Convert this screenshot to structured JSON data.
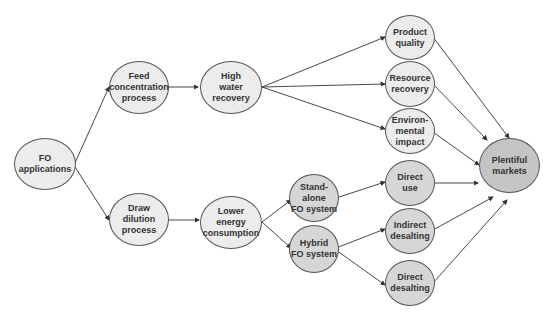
{
  "diagram": {
    "nodes": {
      "fo_applications": "FO\napplications",
      "feed_concentration": "Feed\nconcentration\nprocess",
      "draw_dilution": "Draw\ndilution\nprocess",
      "high_water_recovery": "High\nwater\nrecovery",
      "lower_energy": "Lower\nenergy\nconsumption",
      "product_quality": "Product\nquality",
      "resource_recovery": "Resource\nrecovery",
      "environmental_impact": "Environ-\nmental\nimpact",
      "standalone_fo": "Stand-alone\nFO system",
      "hybrid_fo": "Hybrid\nFO system",
      "direct_use": "Direct\nuse",
      "indirect_desalting": "Indirect\ndesalting",
      "direct_desalting": "Direct\ndesalting",
      "plentiful_markets": "Plentiful\nmarkets"
    },
    "edges": [
      [
        "fo_applications",
        "feed_concentration"
      ],
      [
        "fo_applications",
        "draw_dilution"
      ],
      [
        "feed_concentration",
        "high_water_recovery"
      ],
      [
        "draw_dilution",
        "lower_energy"
      ],
      [
        "high_water_recovery",
        "product_quality"
      ],
      [
        "high_water_recovery",
        "resource_recovery"
      ],
      [
        "high_water_recovery",
        "environmental_impact"
      ],
      [
        "lower_energy",
        "standalone_fo"
      ],
      [
        "lower_energy",
        "hybrid_fo"
      ],
      [
        "standalone_fo",
        "direct_use"
      ],
      [
        "hybrid_fo",
        "indirect_desalting"
      ],
      [
        "hybrid_fo",
        "direct_desalting"
      ],
      [
        "product_quality",
        "plentiful_markets"
      ],
      [
        "resource_recovery",
        "plentiful_markets"
      ],
      [
        "environmental_impact",
        "plentiful_markets"
      ],
      [
        "direct_use",
        "plentiful_markets"
      ],
      [
        "indirect_desalting",
        "plentiful_markets"
      ],
      [
        "direct_desalting",
        "plentiful_markets"
      ]
    ],
    "colors": {
      "light": "#ececec",
      "mid": "#d6d6d6",
      "dark": "#c4c4c4",
      "stroke": "#555555"
    }
  }
}
